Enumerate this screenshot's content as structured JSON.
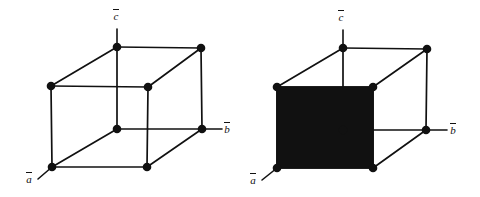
{
  "figure": {
    "type": "crystal-unit-cell-diagram",
    "background_color": "#ffffff",
    "line_color": "#111111",
    "fill_color": "#111111",
    "vertex_color": "#111111",
    "panel_count": 2
  },
  "chart_data": {
    "type": "diagram",
    "title": "",
    "panels": [
      {
        "name": "left-unit-cell",
        "shaded_face": null,
        "vertices": [
          {
            "id": "top-back-left",
            "x": 117,
            "y": 47
          },
          {
            "id": "top-back-right",
            "x": 201,
            "y": 48
          },
          {
            "id": "top-front-left",
            "x": 51,
            "y": 86
          },
          {
            "id": "top-front-right",
            "x": 148,
            "y": 87
          },
          {
            "id": "bottom-back-left",
            "x": 117,
            "y": 129
          },
          {
            "id": "bottom-back-right",
            "x": 202,
            "y": 129
          },
          {
            "id": "bottom-front-left",
            "x": 52,
            "y": 167
          },
          {
            "id": "bottom-front-right",
            "x": 147,
            "y": 167
          }
        ],
        "axes": [
          {
            "id": "c",
            "label": "c",
            "overbar": true,
            "from": [
              117,
              47
            ],
            "to": [
              117,
              29
            ],
            "label_x": 113,
            "label_y": 9
          },
          {
            "id": "b",
            "label": "b",
            "overbar": true,
            "from": [
              202,
              129
            ],
            "to": [
              222,
              129
            ],
            "label_x": 224,
            "label_y": 122
          },
          {
            "id": "a",
            "label": "a",
            "overbar": true,
            "from": [
              52,
              167
            ],
            "to": [
              38,
              179
            ],
            "label_x": 26,
            "label_y": 172
          }
        ]
      },
      {
        "name": "right-unit-cell",
        "shaded_face": "front-face",
        "vertices": [
          {
            "id": "top-back-left",
            "x": 343,
            "y": 48
          },
          {
            "id": "top-back-right",
            "x": 427,
            "y": 49
          },
          {
            "id": "top-front-left",
            "x": 277,
            "y": 87
          },
          {
            "id": "top-front-right",
            "x": 373,
            "y": 87
          },
          {
            "id": "bottom-back-left",
            "x": 343,
            "y": 130
          },
          {
            "id": "bottom-back-right",
            "x": 426,
            "y": 130
          },
          {
            "id": "bottom-front-left",
            "x": 277,
            "y": 168
          },
          {
            "id": "bottom-front-right",
            "x": 373,
            "y": 168
          }
        ],
        "axes": [
          {
            "id": "c",
            "label": "c",
            "overbar": true,
            "from": [
              343,
              48
            ],
            "to": [
              343,
              30
            ],
            "label_x": 338,
            "label_y": 10
          },
          {
            "id": "b",
            "label": "b",
            "overbar": true,
            "from": [
              426,
              130
            ],
            "to": [
              447,
              130
            ],
            "label_x": 450,
            "label_y": 123
          },
          {
            "id": "a",
            "label": "a",
            "overbar": true,
            "from": [
              277,
              168
            ],
            "to": [
              262,
              180
            ],
            "label_x": 250,
            "label_y": 173
          }
        ]
      }
    ]
  },
  "labels": {
    "a_vector": "a",
    "b_vector": "b",
    "c_vector": "c"
  }
}
